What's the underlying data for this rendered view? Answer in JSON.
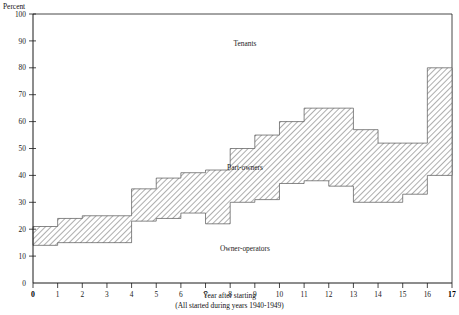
{
  "chart_data": {
    "type": "area",
    "title": "",
    "subtitle": "",
    "unit_label": "Percent",
    "xlabel": "Year after starting",
    "xlabel_note": "(All started during years 1940-1949)",
    "ylabel": "",
    "ylim": [
      0,
      100
    ],
    "xlim": [
      0,
      17
    ],
    "grid": false,
    "legend_position": "inline-annotations",
    "y_ticks": [
      0,
      10,
      20,
      30,
      40,
      50,
      60,
      70,
      80,
      90,
      100
    ],
    "y_tick_labels": [
      "0",
      "10",
      "20",
      "30",
      "40",
      "50",
      "60",
      "70",
      "80",
      "90",
      "100"
    ],
    "x_ticks": [
      0,
      1,
      2,
      3,
      4,
      5,
      6,
      7,
      8,
      9,
      10,
      11,
      12,
      13,
      14,
      15,
      16,
      17
    ],
    "x_tick_labels": [
      "0",
      "1",
      "2",
      "3",
      "4",
      "5",
      "6",
      "7",
      "8",
      "9",
      "10",
      "11",
      "12",
      "13",
      "14",
      "15",
      "16",
      "17"
    ],
    "annotations": [
      {
        "text": "Tenants",
        "x": 8.6,
        "y": 88
      },
      {
        "text": "Part-owners",
        "x": 8.6,
        "y": 42
      },
      {
        "text": "Owner-operators",
        "x": 8.6,
        "y": 12
      }
    ],
    "band_name": "Part-owners",
    "area_above_name": "Tenants",
    "area_below_name": "Owner-operators",
    "steps": [
      {
        "x0": 0,
        "x1": 1,
        "lower": 14,
        "upper": 21
      },
      {
        "x0": 1,
        "x1": 2,
        "lower": 15,
        "upper": 24
      },
      {
        "x0": 2,
        "x1": 3,
        "lower": 15,
        "upper": 25
      },
      {
        "x0": 3,
        "x1": 4,
        "lower": 15,
        "upper": 25
      },
      {
        "x0": 4,
        "x1": 5,
        "lower": 23,
        "upper": 35
      },
      {
        "x0": 5,
        "x1": 6,
        "lower": 24,
        "upper": 39
      },
      {
        "x0": 6,
        "x1": 7,
        "lower": 26,
        "upper": 41
      },
      {
        "x0": 7,
        "x1": 8,
        "lower": 22,
        "upper": 42
      },
      {
        "x0": 8,
        "x1": 9,
        "lower": 30,
        "upper": 50
      },
      {
        "x0": 9,
        "x1": 10,
        "lower": 31,
        "upper": 55
      },
      {
        "x0": 10,
        "x1": 11,
        "lower": 37,
        "upper": 60
      },
      {
        "x0": 11,
        "x1": 12,
        "lower": 38,
        "upper": 65
      },
      {
        "x0": 12,
        "x1": 13,
        "lower": 36,
        "upper": 65
      },
      {
        "x0": 13,
        "x1": 14,
        "lower": 30,
        "upper": 57
      },
      {
        "x0": 14,
        "x1": 15,
        "lower": 30,
        "upper": 52
      },
      {
        "x0": 15,
        "x1": 16,
        "lower": 33,
        "upper": 52
      },
      {
        "x0": 16,
        "x1": 17,
        "lower": 40,
        "upper": 80
      }
    ],
    "colors": {
      "axis": "#1a1a1a",
      "band_outline": "#555555",
      "hatch": "#6b6b6b",
      "background": "#ffffff",
      "text": "#1a1a1a"
    }
  }
}
